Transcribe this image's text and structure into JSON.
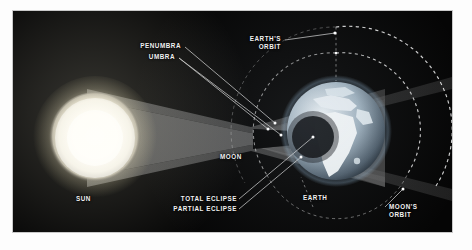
{
  "diagram": {
    "background_color": "#050505",
    "labels": {
      "sun": "SUN",
      "moon": "MOON",
      "earth": "EARTH",
      "penumbra": "PENUMBRA",
      "umbra": "UMBRA",
      "earths_orbit_line1": "EARTH'S",
      "earths_orbit_line2": "ORBIT",
      "moons_orbit_line1": "MOON'S",
      "moons_orbit_line2": "ORBIT",
      "total_eclipse": "TOTAL ECLIPSE",
      "partial_eclipse": "PARTIAL ECLIPSE"
    },
    "bodies": [
      {
        "name": "sun",
        "label": "SUN",
        "cx": 82,
        "cy": 127,
        "r": 46,
        "color": "#fffdf0"
      },
      {
        "name": "moon",
        "label": "MOON",
        "cx": 238,
        "cy": 128,
        "r": 11,
        "color": "#cfc9bd"
      },
      {
        "name": "earth",
        "label": "EARTH",
        "cx": 323,
        "cy": 120,
        "r": 49,
        "color": "#b9c6cf"
      }
    ],
    "orbits": [
      {
        "name": "moons-orbit",
        "label": "MOON'S ORBIT",
        "cx": 323,
        "cy": 120,
        "r": 78,
        "color": "#d8d8d8",
        "style": "dashed"
      },
      {
        "name": "earths-orbit",
        "label": "EARTH'S ORBIT",
        "cx": 323,
        "cy": 120,
        "r": 104,
        "color": "#e2e2e2",
        "style": "dashed"
      }
    ],
    "shadow_regions": [
      {
        "name": "penumbra",
        "label": "PENUMBRA",
        "color": "#6e6e6e"
      },
      {
        "name": "umbra",
        "label": "UMBRA",
        "color": "#121212"
      }
    ],
    "eclipse_zones": [
      {
        "name": "total-eclipse",
        "label": "TOTAL ECLIPSE"
      },
      {
        "name": "partial-eclipse",
        "label": "PARTIAL ECLIPSE"
      }
    ]
  }
}
